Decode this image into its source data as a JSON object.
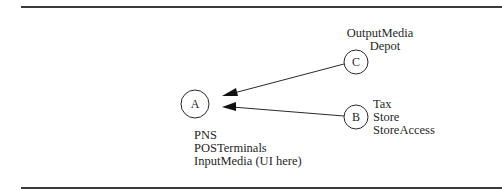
{
  "diagram": {
    "nodes": {
      "a": {
        "letter": "A",
        "labels": [
          "PNS",
          "POSTerminals",
          "InputMedia (UI here)"
        ]
      },
      "b": {
        "letter": "B",
        "labels": [
          "Tax",
          "Store",
          "StoreAccess"
        ]
      },
      "c": {
        "letter": "C",
        "labels": [
          "OutputMedia",
          "Depot"
        ]
      }
    },
    "edges": [
      {
        "from": "C",
        "to": "A"
      },
      {
        "from": "B",
        "to": "A"
      }
    ],
    "colors": {
      "stroke": "#2a2a2a",
      "rule": "#3a3a3a",
      "background": "#ffffff"
    }
  }
}
